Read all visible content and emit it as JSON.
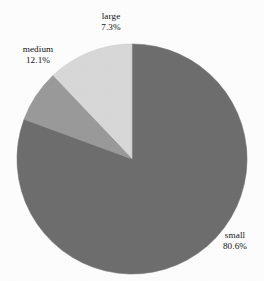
{
  "chart_data": {
    "type": "pie",
    "title": "",
    "subtitle": "",
    "xlabel": "",
    "ylabel": "",
    "legend_position": "none",
    "grid": false,
    "start_angle_deg": 90,
    "direction": "clockwise",
    "categories": [
      "small",
      "large",
      "medium"
    ],
    "values": [
      80.6,
      7.3,
      12.1
    ],
    "units": "%",
    "slices": [
      {
        "label": "small",
        "percent_text": "80.6%",
        "value": 80.6,
        "color": "#6e6e6e",
        "label_position": "bottom-right"
      },
      {
        "label": "large",
        "percent_text": "7.3%",
        "value": 7.3,
        "color": "#9a9a9a",
        "label_position": "top"
      },
      {
        "label": "medium",
        "percent_text": "12.1%",
        "value": 12.1,
        "color": "#d8d8d8",
        "label_position": "top-left"
      }
    ],
    "background_color": "#fdfdfd",
    "text_color": "#121212",
    "edge_color": "#8f8f8f"
  },
  "labels": {
    "large": {
      "name": "large",
      "pct": "7.3%"
    },
    "medium": {
      "name": "medium",
      "pct": "12.1%"
    },
    "small": {
      "name": "small",
      "pct": "80.6%"
    }
  }
}
